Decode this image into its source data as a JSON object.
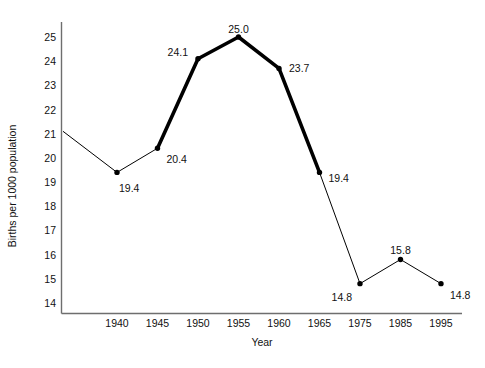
{
  "chart_data": {
    "type": "line",
    "title": "U.S. Birthrate 1935-1995",
    "xlabel": "Year",
    "ylabel": "Births per 1000 population",
    "categories": [
      "1940",
      "1945",
      "1950",
      "1955",
      "1960",
      "1965",
      "1975",
      "1985",
      "1995"
    ],
    "values": [
      19.4,
      20.4,
      24.1,
      25.0,
      23.7,
      19.4,
      14.8,
      15.8,
      14.8
    ],
    "point_labels": [
      "19.4",
      "20.4",
      "24.1",
      "25.0",
      "23.7",
      "19.4",
      "14.8",
      "15.8",
      "14.8"
    ],
    "lead_in_value": 21.1,
    "ylim": [
      13.6,
      25.5
    ],
    "ytick_labels": [
      "25",
      "24",
      "23",
      "22",
      "21",
      "20",
      "19",
      "18",
      "17",
      "16",
      "15",
      "14"
    ],
    "ytick_values": [
      25,
      24,
      23,
      22,
      21,
      20,
      19,
      18,
      17,
      16,
      15,
      14
    ],
    "grid": false,
    "legend": "none",
    "highlight_segment": {
      "from": "1945",
      "to": "1965",
      "style": "thick"
    },
    "line_color": "#000000",
    "marker_color": "#000000",
    "axis_color": "#6e6e6e"
  },
  "axis": {
    "y_title": "Births per 1000 population",
    "x_title": "Year"
  }
}
